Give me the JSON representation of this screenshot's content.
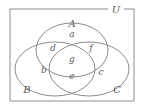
{
  "figure": {
    "stroke_color": "#8c8c8c",
    "label_color": "#5a5a5a",
    "background_color": "#ffffff"
  },
  "universe": {
    "label": "U"
  },
  "sets": [
    {
      "key": "A",
      "label": "A",
      "position": "top"
    },
    {
      "key": "B",
      "label": "B",
      "position": "lower-left"
    },
    {
      "key": "C",
      "label": "C",
      "position": "lower-right"
    }
  ],
  "regions": [
    {
      "key": "a",
      "label": "a",
      "meaning": "A only"
    },
    {
      "key": "b",
      "label": "b",
      "meaning": "B only"
    },
    {
      "key": "c",
      "label": "c",
      "meaning": "C only"
    },
    {
      "key": "d",
      "label": "d",
      "meaning": "A and B only"
    },
    {
      "key": "e",
      "label": "e",
      "meaning": "B and C only"
    },
    {
      "key": "f",
      "label": "f",
      "meaning": "A and C only"
    },
    {
      "key": "g",
      "label": "g",
      "meaning": "A and B and C"
    }
  ]
}
